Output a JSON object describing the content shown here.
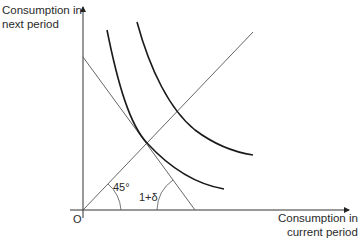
{
  "diagram": {
    "type": "economics-indifference-curve",
    "axes": {
      "y_label_line1": "Consumption in",
      "y_label_line2": "next period",
      "x_label_line1": "Consumption in",
      "x_label_line2": "current period",
      "origin_label": "O"
    },
    "annotations": {
      "diagonal_angle": "45°",
      "budget_slope": "1+δ"
    },
    "elements": [
      {
        "name": "45-degree-line",
        "description": "Line from origin at 45°"
      },
      {
        "name": "budget-line",
        "description": "Straight line with slope −(1+δ)"
      },
      {
        "name": "indifference-curve-1",
        "description": "Inner convex curve tangent to budget line on the 45° line"
      },
      {
        "name": "indifference-curve-2",
        "description": "Outer convex curve, higher utility"
      }
    ],
    "colors": {
      "axis": "#333333",
      "thin_line": "#555555",
      "curve": "#1a1a1a"
    }
  }
}
